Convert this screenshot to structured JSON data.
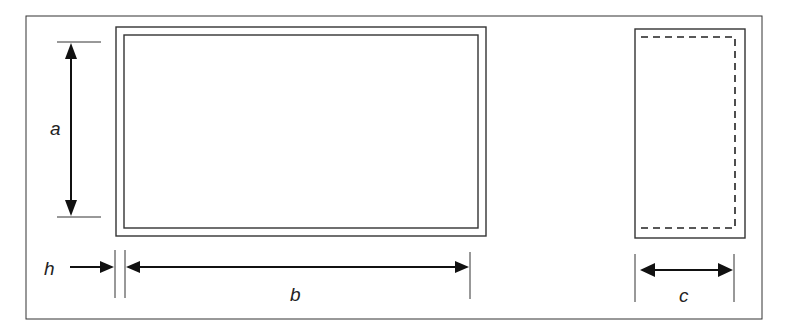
{
  "diagram": {
    "title": "",
    "views": [
      {
        "name": "front-view",
        "description": "Double-outlined rectangle (frame of thickness h)"
      },
      {
        "name": "side-view",
        "description": "Rectangle with dashed inner outline indicating depth"
      }
    ],
    "dimensions": [
      {
        "id": "a",
        "label": "a",
        "meaning": "height of front view",
        "orientation": "vertical"
      },
      {
        "id": "b",
        "label": "b",
        "meaning": "width of front view",
        "orientation": "horizontal"
      },
      {
        "id": "h",
        "label": "h",
        "meaning": "frame thickness",
        "orientation": "horizontal"
      },
      {
        "id": "c",
        "label": "c",
        "meaning": "depth of side view",
        "orientation": "horizontal"
      }
    ],
    "colors": {
      "stroke": "#333333",
      "arrow": "#111111",
      "background": "#ffffff"
    }
  }
}
